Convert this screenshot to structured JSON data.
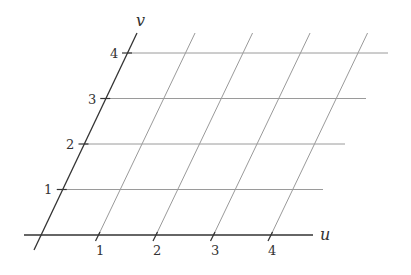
{
  "diagram": {
    "title": "",
    "type": "skewed coordinate grid",
    "axes": {
      "u": {
        "label": "u",
        "ticks": [
          "1",
          "2",
          "3",
          "4"
        ]
      },
      "v": {
        "label": "v",
        "ticks": [
          "1",
          "2",
          "3",
          "4"
        ]
      }
    },
    "grid": {
      "u_lines": [
        1,
        2,
        3,
        4
      ],
      "v_lines": [
        1,
        2,
        3,
        4
      ]
    },
    "colors": {
      "axis": "#333333",
      "grid": "#9a9a9a",
      "background": "#ffffff"
    }
  }
}
